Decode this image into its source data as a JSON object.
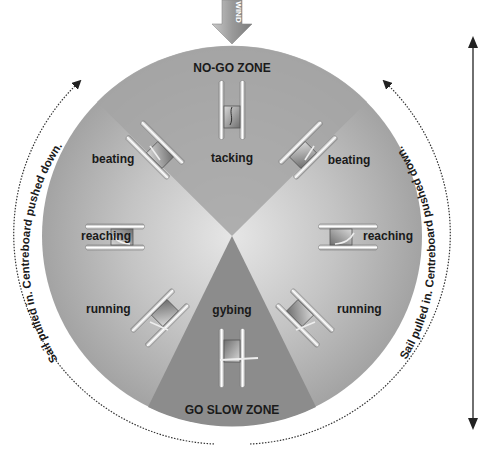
{
  "diagram": {
    "wind_label": "WIND",
    "zones": {
      "no_go": "NO-GO ZONE",
      "go_slow": "GO SLOW ZONE"
    },
    "positions": {
      "tacking": "tacking",
      "beating_left": "beating",
      "beating_right": "beating",
      "reaching_left": "reaching",
      "reaching_right": "reaching",
      "running_left": "running",
      "running_right": "running",
      "gybing": "gybing"
    },
    "arc_captions": {
      "left": "Sail pulled in. Centreboard pushed down.",
      "right": "Sail pulled in. Centreboard pushed down."
    },
    "colors": {
      "circle_outer": "#9a9a9a",
      "circle_center": "#e2e2e2",
      "wedge_dark": "#8a8a8a",
      "text": "#1a1a1a",
      "arrow": "#333333"
    }
  }
}
